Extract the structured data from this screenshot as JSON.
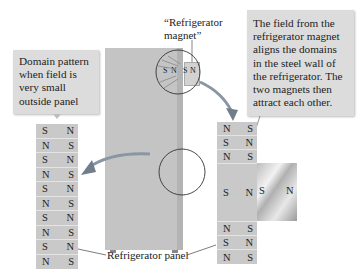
{
  "callouts": {
    "left": {
      "lines": [
        "Domain pattern",
        "when field is",
        "very small",
        "outside panel"
      ]
    },
    "right": {
      "lines": [
        "The field from the",
        "refrigerator magnet",
        "aligns the domains",
        "in the steel wall of",
        "the refrigerator. The",
        "two magnets then",
        "attract each other."
      ]
    }
  },
  "labels": {
    "magnet_line1": "“Refrigerator",
    "magnet_line2": "magnet”",
    "panel": "Refrigerator panel"
  },
  "left_panel": {
    "rows": [
      {
        "l": "S",
        "r": "N"
      },
      {
        "l": "N",
        "r": "S"
      },
      {
        "l": "S",
        "r": "N"
      },
      {
        "l": "N",
        "r": "S"
      },
      {
        "l": "S",
        "r": "N"
      },
      {
        "l": "N",
        "r": "S"
      },
      {
        "l": "S",
        "r": "N"
      },
      {
        "l": "N",
        "r": "S"
      },
      {
        "l": "S",
        "r": "N"
      },
      {
        "l": "N",
        "r": "S"
      }
    ]
  },
  "right_panel": {
    "top_rows": [
      {
        "l": "N",
        "r": "S"
      },
      {
        "l": "S",
        "r": "N"
      },
      {
        "l": "N",
        "r": "S"
      }
    ],
    "aligned": {
      "l": "S",
      "r": "N"
    },
    "bottom_rows": [
      {
        "l": "N",
        "r": "S"
      },
      {
        "l": "S",
        "r": "N"
      },
      {
        "l": "N",
        "r": "S"
      }
    ]
  },
  "magnet": {
    "l": "S",
    "r": "N"
  },
  "fridge_magnet_small": {
    "l": "S",
    "r": "N"
  },
  "fridge_domain_small": {
    "l": "S",
    "r": "N"
  },
  "colors": {
    "panel": "#c9c9c9",
    "callout": "#dcdcdc",
    "fridge": "#c4c4c4",
    "arrow": "#7a8a9a"
  }
}
